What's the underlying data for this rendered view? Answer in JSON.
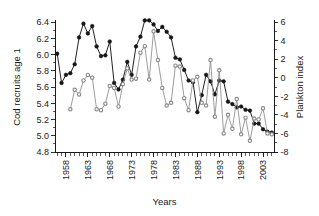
{
  "chart_data": {
    "type": "line",
    "title": "",
    "xlabel": "Years",
    "ylabel": "Cod recruits age 1",
    "y2label": "Plankton index",
    "grid": false,
    "legend": "none",
    "xlim": [
      1955.5,
      2005.5
    ],
    "ylim": [
      4.8,
      6.4
    ],
    "y2lim": [
      -8,
      6
    ],
    "yticks": [
      "4.8",
      "5.0",
      "5.2",
      "5.4",
      "5.6",
      "5.8",
      "6.0",
      "6.2",
      "6.4"
    ],
    "y2ticks": [
      "-8",
      "-6",
      "-4",
      "-2",
      "0",
      "2",
      "4",
      "6"
    ],
    "xticks": [
      "1958",
      "1963",
      "1968",
      "1973",
      "1978",
      "1983",
      "1988",
      "1993",
      "1998",
      "2003"
    ],
    "x": [
      1956,
      1957,
      1958,
      1959,
      1960,
      1961,
      1962,
      1963,
      1964,
      1965,
      1966,
      1967,
      1968,
      1969,
      1970,
      1971,
      1972,
      1973,
      1974,
      1975,
      1976,
      1977,
      1978,
      1979,
      1980,
      1981,
      1982,
      1983,
      1984,
      1985,
      1986,
      1987,
      1988,
      1989,
      1990,
      1991,
      1992,
      1993,
      1994,
      1995,
      1996,
      1997,
      1998,
      1999,
      2000,
      2001,
      2002,
      2003,
      2004,
      2005
    ],
    "series": [
      {
        "name": "Cod recruits age 1",
        "axis": "left",
        "marker": "filled-circle",
        "color": "#161616",
        "values": [
          6.01,
          5.65,
          5.75,
          5.77,
          5.88,
          6.21,
          6.38,
          6.26,
          6.35,
          6.1,
          5.98,
          5.99,
          6.16,
          5.65,
          5.57,
          5.69,
          5.91,
          5.75,
          6.1,
          6.22,
          6.42,
          6.42,
          6.37,
          6.29,
          6.34,
          6.28,
          6.21,
          5.96,
          5.94,
          5.81,
          5.68,
          5.66,
          5.29,
          5.5,
          5.75,
          5.67,
          5.51,
          5.68,
          5.67,
          5.42,
          5.39,
          5.35,
          5.36,
          5.32,
          5.31,
          5.15,
          5.15,
          5.08,
          5.05,
          5.04
        ]
      },
      {
        "name": "Plankton index",
        "axis": "right",
        "marker": "open-circle",
        "color": "#8a8a8a",
        "values": [
          null,
          null,
          null,
          -3.4,
          -1.3,
          -1.8,
          -0.3,
          0.3,
          0.0,
          -3.4,
          -3.5,
          -2.8,
          -0.9,
          -1.1,
          -3.1,
          -0.7,
          1.0,
          -0.2,
          -0.1,
          2.7,
          3.4,
          -0.2,
          5.0,
          1.9,
          -1.1,
          -3.0,
          -2.7,
          1.3,
          1.2,
          -2.2,
          -3.5,
          -0.3,
          0.1,
          -2.7,
          -3.0,
          1.9,
          -4.2,
          0.8,
          -6.0,
          -4.0,
          -5.5,
          -2.3,
          -6.1,
          -4.3,
          -6.8,
          -4.4,
          -4.5,
          -3.3,
          -6.0,
          -6.1
        ]
      }
    ]
  }
}
